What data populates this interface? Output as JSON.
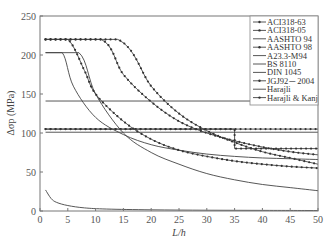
{
  "chart_data": {
    "type": "line",
    "title": "",
    "xlabel": "L/h",
    "ylabel": "Δσp (MPa)",
    "xlim": [
      0,
      50
    ],
    "ylim": [
      0,
      250
    ],
    "xticks": [
      0,
      5,
      10,
      15,
      20,
      25,
      30,
      35,
      40,
      45,
      50
    ],
    "yticks": [
      0,
      50,
      100,
      150,
      200,
      250
    ],
    "grid": false,
    "legend_position": "upper right",
    "series": [
      {
        "name": "ACI318-63",
        "marker": "dot",
        "x": [
          1,
          50
        ],
        "y": [
          105,
          105
        ]
      },
      {
        "name": "ACI318-05",
        "marker": "dot",
        "x": [
          1,
          35,
          35,
          50
        ],
        "y": [
          105,
          105,
          80,
          80
        ]
      },
      {
        "name": "AASHTO 94",
        "marker": "none",
        "x": [
          1,
          50
        ],
        "y": [
          141,
          141
        ]
      },
      {
        "name": "AASHTO 98",
        "marker": "dot",
        "x": [
          1,
          14,
          20,
          25,
          30,
          35,
          40,
          45,
          50
        ],
        "y": [
          220,
          220,
          160,
          125,
          103,
          88,
          76,
          68,
          60
        ]
      },
      {
        "name": "A23.3-M94",
        "marker": "none",
        "x": [
          1,
          4,
          6,
          10,
          15,
          20,
          25,
          30,
          35,
          40,
          45,
          50
        ],
        "y": [
          203,
          203,
          160,
          120,
          98,
          85,
          78,
          73,
          70,
          68,
          67,
          66
        ]
      },
      {
        "name": "BS 8110",
        "marker": "none",
        "x": [
          1,
          50
        ],
        "y": [
          101,
          101
        ]
      },
      {
        "name": "DIN 1045",
        "marker": "none",
        "x": [
          1,
          7,
          10,
          15,
          20,
          25,
          30,
          35,
          40,
          45,
          50
        ],
        "y": [
          203,
          203,
          150,
          100,
          75,
          60,
          48,
          40,
          34,
          30,
          26
        ]
      },
      {
        "name": "JGJ92－2004",
        "marker": "dot",
        "x": [
          1,
          5,
          8,
          10,
          15,
          20,
          25,
          30,
          35,
          40,
          45,
          50
        ],
        "y": [
          220,
          220,
          180,
          150,
          115,
          92,
          78,
          70,
          64,
          60,
          57,
          55
        ]
      },
      {
        "name": "Harajli",
        "marker": "none",
        "x": [
          1,
          2,
          3,
          5,
          8,
          12,
          20,
          30,
          40,
          50
        ],
        "y": [
          27,
          16,
          11,
          7,
          4,
          2.5,
          1.5,
          1,
          0.8,
          0.6
        ]
      },
      {
        "name": "Harajli & Kanj",
        "marker": "dot",
        "x": [
          1,
          11,
          15,
          20,
          25,
          30,
          35,
          40,
          45,
          50
        ],
        "y": [
          220,
          220,
          175,
          140,
          115,
          100,
          90,
          82,
          76,
          72
        ]
      }
    ]
  }
}
